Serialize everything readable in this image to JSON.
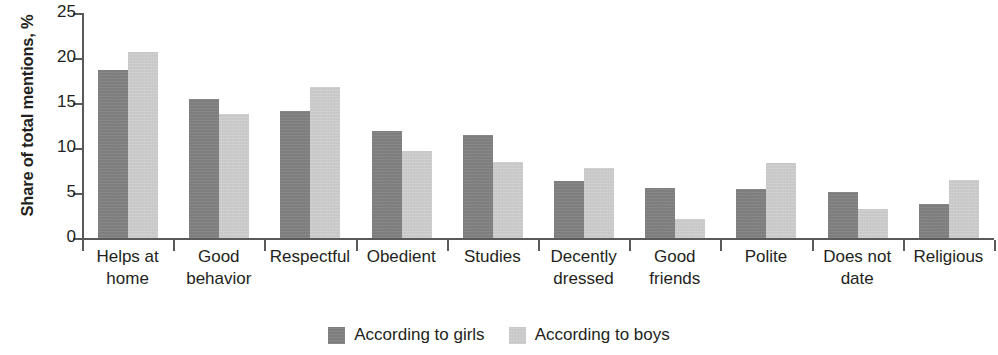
{
  "chart_data": {
    "type": "bar",
    "title": "",
    "subtitle": "",
    "xlabel": "",
    "ylabel": "Share of total mentions, %",
    "ylim": [
      0,
      25
    ],
    "yticks": [
      0,
      5,
      10,
      15,
      20,
      25
    ],
    "ytick_labels": [
      "0",
      "5",
      "10",
      "15",
      "20",
      "25"
    ],
    "grid": false,
    "legend_position": "bottom-center",
    "categories": [
      "Helps at home",
      "Good behavior",
      "Respectful",
      "Obedient",
      "Studies",
      "Decently dressed",
      "Good friends",
      "Polite",
      "Does not date",
      "Religious"
    ],
    "category_lines": [
      [
        "Helps at",
        "home"
      ],
      [
        "Good",
        "behavior"
      ],
      [
        "Respectful",
        ""
      ],
      [
        "Obedient",
        ""
      ],
      [
        "Studies",
        ""
      ],
      [
        "Decently",
        "dressed"
      ],
      [
        "Good",
        "friends"
      ],
      [
        "Polite",
        ""
      ],
      [
        "Does not",
        "date"
      ],
      [
        "Religious",
        ""
      ]
    ],
    "series": [
      {
        "name": "According to girls",
        "color": "#7d7d7d",
        "values": [
          18.7,
          15.4,
          14.1,
          11.9,
          11.5,
          6.3,
          5.6,
          5.5,
          5.1,
          3.8
        ]
      },
      {
        "name": "According to boys",
        "color": "#cdcdcd",
        "values": [
          20.7,
          13.8,
          16.8,
          9.7,
          8.5,
          7.8,
          2.1,
          8.3,
          3.2,
          6.5
        ]
      }
    ]
  },
  "legend": {
    "items": [
      {
        "label": "According to girls",
        "color": "#7d7d7d"
      },
      {
        "label": "According to boys",
        "color": "#cdcdcd"
      }
    ]
  }
}
